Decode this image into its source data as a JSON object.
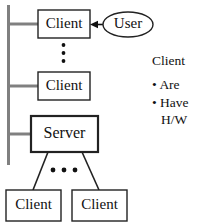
{
  "diagram": {
    "type": "client-server-architecture",
    "bus": {
      "label": "network-bus",
      "color": "#808080"
    },
    "nodes": [
      {
        "id": "client-top",
        "label": "Client",
        "shape": "rect"
      },
      {
        "id": "user",
        "label": "User",
        "shape": "ellipse"
      },
      {
        "id": "client-second",
        "label": "Client",
        "shape": "rect"
      },
      {
        "id": "server",
        "label": "Server",
        "shape": "rect"
      },
      {
        "id": "client-bottom-left",
        "label": "Client",
        "shape": "rect"
      },
      {
        "id": "client-bottom-right",
        "label": "Client",
        "shape": "rect"
      }
    ],
    "vertical_ellipsis": "⋮",
    "horizontal_ellipsis": "•••"
  },
  "notes": {
    "title": "Client",
    "items": [
      {
        "bullet": "•",
        "text": "Are"
      },
      {
        "bullet": "•",
        "text": "Have",
        "continuation": "H/W"
      }
    ]
  }
}
